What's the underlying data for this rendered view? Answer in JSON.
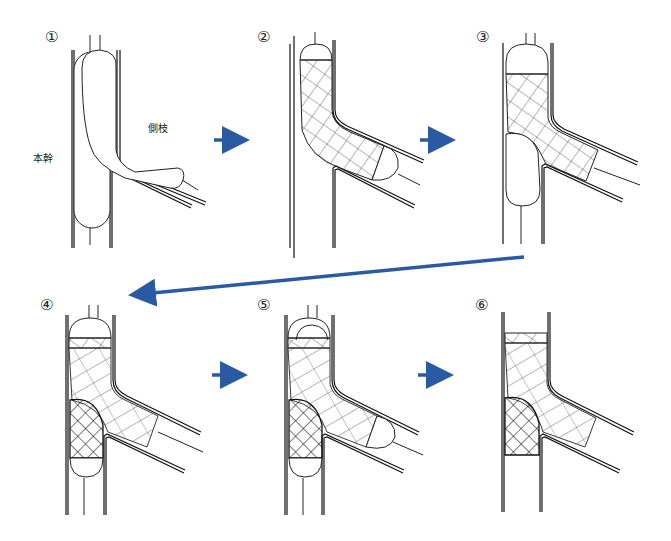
{
  "figure": {
    "type": "procedure-diagram",
    "labels": {
      "main_trunk": "本幹",
      "side_branch": "側枝"
    },
    "steps": [
      {
        "number": "①",
        "description": "Balloons positioned in main trunk and side branch"
      },
      {
        "number": "②",
        "description": "Stent deployed from main trunk into side branch"
      },
      {
        "number": "③",
        "description": "Balloon in main trunk lower segment, stent in side branch"
      },
      {
        "number": "④",
        "description": "Second stent deployed in main trunk with balloons"
      },
      {
        "number": "⑤",
        "description": "Kissing balloon inflation in main trunk and side branch"
      },
      {
        "number": "⑥",
        "description": "Final result with both stents, balloons removed"
      }
    ],
    "arrow_color": "#2a5aa3",
    "line_color": "#111111"
  }
}
